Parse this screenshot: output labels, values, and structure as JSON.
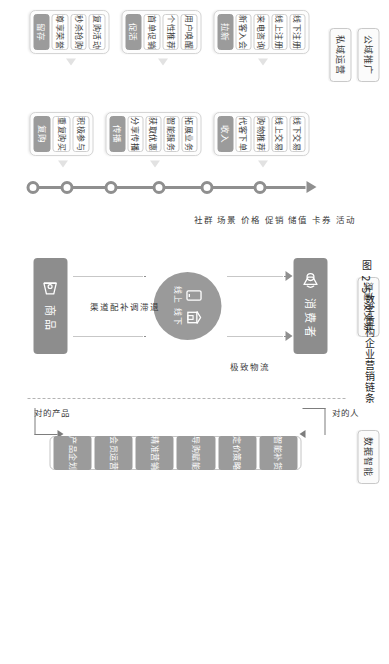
{
  "figure": {
    "caption_number": "图 2-5",
    "caption_title": "数字重构企业营销链条"
  },
  "lanes": [
    {
      "id": "public-domain",
      "label": "公域推广"
    },
    {
      "id": "private-domain",
      "label": "私域运营"
    },
    {
      "id": "channel-trade",
      "label": "渠道及交易"
    },
    {
      "id": "data-intelligence",
      "label": "数据智能"
    }
  ],
  "stages": [
    {
      "id": "acquire",
      "head": "拉新",
      "items": [
        "线下注册",
        "线上注册",
        "来电咨询",
        "新客入会"
      ]
    },
    {
      "id": "activate",
      "head": "促活",
      "items": [
        "用户唤醒",
        "个性推荐",
        "首单促销"
      ]
    },
    {
      "id": "retain",
      "head": "留存",
      "items": [
        "复购活动",
        "秒杀抢购",
        "尊享荣誉"
      ]
    },
    {
      "id": "revenue",
      "head": "收入",
      "items": [
        "线下交易",
        "线上交易",
        "购物推荐",
        "代客下单"
      ]
    },
    {
      "id": "spread",
      "head": "传播",
      "items": [
        "拓展业务",
        "智能服务",
        "获取优惠",
        "分享传播"
      ]
    },
    {
      "id": "repurchase",
      "head": "复购",
      "items": [
        "积极参与",
        "重复购买"
      ]
    }
  ],
  "center": {
    "consumer_label": "消费者",
    "consumer_icon": "megaphone-icon",
    "product_label": "商品",
    "product_icon": "package-icon",
    "hub": {
      "online_label": "线上",
      "online_icon": "mobile-icon",
      "offline_label": "线下",
      "offline_icon": "store-icon"
    },
    "marketing_levers": "社群 场景 价格 促销 储值 卡券 活动",
    "channel_flow": "渠道配补调滞退",
    "logistics": "极致物流",
    "right_person": "对的人",
    "right_product": "对的产品"
  },
  "data_intelligence": {
    "items": [
      "产品企划",
      "会员运营",
      "精准营销",
      "导购赋能",
      "定价策略",
      "智能补货"
    ]
  },
  "colors": {
    "accent_grey": "#9b9b9b",
    "block_grey": "#8d8d8d",
    "line_grey": "#8f8f8f",
    "card_border": "#d5d5d5",
    "background": "#ffffff"
  }
}
